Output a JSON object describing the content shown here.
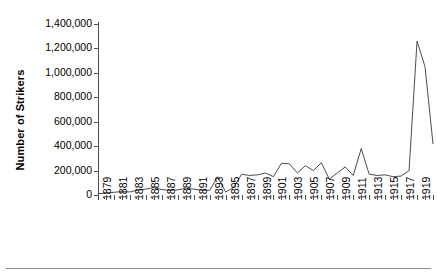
{
  "chart_data": {
    "type": "line",
    "title": "",
    "xlabel": "",
    "ylabel": "Number of Strikers",
    "ylim": [
      0,
      1400000
    ],
    "ytick_values": [
      1400000,
      1200000,
      1000000,
      800000,
      600000,
      400000,
      200000,
      0
    ],
    "ytick_labels": [
      "1,400,000",
      "1,200,000",
      "1,000,000",
      "800,000",
      "600,000",
      "400,000",
      "200,000",
      "0"
    ],
    "grid": false,
    "legend": "none",
    "line_color": "#4d4d4d",
    "x": [
      1879,
      1880,
      1881,
      1882,
      1883,
      1884,
      1885,
      1886,
      1887,
      1888,
      1889,
      1890,
      1891,
      1892,
      1893,
      1894,
      1895,
      1896,
      1897,
      1898,
      1899,
      1900,
      1901,
      1902,
      1903,
      1904,
      1905,
      1906,
      1907,
      1908,
      1909,
      1910,
      1911,
      1912,
      1913,
      1914,
      1915,
      1916,
      1917,
      1918,
      1919,
      1920,
      1921
    ],
    "xtick_labels": [
      "1879",
      "1881",
      "1883",
      "1885",
      "1887",
      "1889",
      "1891",
      "1893",
      "1895",
      "1897",
      "1899",
      "1901",
      "1903",
      "1905",
      "1907",
      "1909",
      "1911",
      "1913",
      "1915",
      "1917",
      "1919",
      "1921"
    ],
    "xtick_step": 2,
    "values": [
      12000,
      15000,
      22000,
      28000,
      25000,
      40000,
      48000,
      60000,
      45000,
      38000,
      42000,
      55000,
      48000,
      40000,
      38000,
      150000,
      25000,
      60000,
      170000,
      160000,
      165000,
      180000,
      150000,
      260000,
      255000,
      180000,
      240000,
      200000,
      265000,
      130000,
      180000,
      230000,
      160000,
      380000,
      170000,
      160000,
      165000,
      150000,
      155000,
      200000,
      1260000,
      1050000,
      420000
    ]
  }
}
